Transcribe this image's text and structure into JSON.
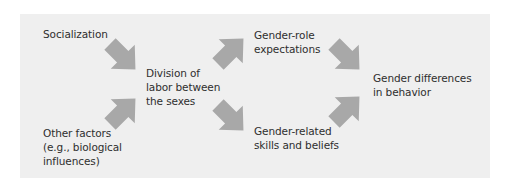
{
  "diagram": {
    "type": "flow",
    "background_color": "#efefef",
    "arrow_color": "#a8a8a8",
    "text_color": "#2e2e2e",
    "nodes": [
      {
        "id": "socialization",
        "label": "Socialization",
        "lines": [
          "Socialization"
        ]
      },
      {
        "id": "other_factors",
        "label": "Other factors (e.g., biological influences)",
        "lines": [
          "Other factors",
          "(e.g., biological",
          "influences)"
        ]
      },
      {
        "id": "division_of_labor",
        "label": "Division of labor between the sexes",
        "lines": [
          "Division of",
          "labor between",
          "the sexes"
        ]
      },
      {
        "id": "gender_role_expectations",
        "label": "Gender-role expectations",
        "lines": [
          "Gender-role",
          "expectations"
        ]
      },
      {
        "id": "gender_related_skills",
        "label": "Gender-related skills and beliefs",
        "lines": [
          "Gender-related",
          "skills and beliefs"
        ]
      },
      {
        "id": "gender_differences",
        "label": "Gender differences in behavior",
        "lines": [
          "Gender differences",
          "in behavior"
        ]
      }
    ],
    "edges": [
      {
        "from": "socialization",
        "to": "division_of_labor",
        "direction": "down-right"
      },
      {
        "from": "other_factors",
        "to": "division_of_labor",
        "direction": "up-right"
      },
      {
        "from": "division_of_labor",
        "to": "gender_role_expectations",
        "direction": "up-right"
      },
      {
        "from": "division_of_labor",
        "to": "gender_related_skills",
        "direction": "down-right"
      },
      {
        "from": "gender_role_expectations",
        "to": "gender_differences",
        "direction": "down-right"
      },
      {
        "from": "gender_related_skills",
        "to": "gender_differences",
        "direction": "up-right"
      }
    ]
  }
}
